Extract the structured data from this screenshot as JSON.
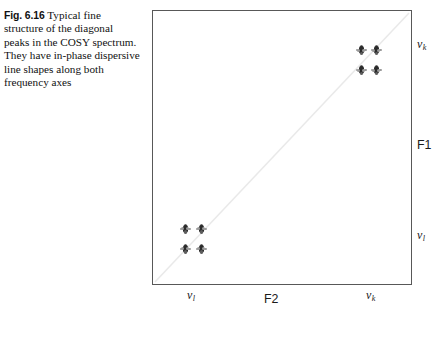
{
  "caption": {
    "figure_number": "Fig. 6.16",
    "text": "Typical fine structure of the diagonal peaks in the COSY spectrum. They have in-phase dispersive line shapes along both frequency axes"
  },
  "chart_data": {
    "type": "scatter",
    "title": "",
    "xlabel": "F2",
    "ylabel": "F1",
    "x_tick_labels": [
      "ν",
      "ν"
    ],
    "x_tick_subscripts": [
      "l",
      "k"
    ],
    "y_tick_labels": [
      "ν",
      "ν"
    ],
    "y_tick_subscripts": [
      "k",
      "l"
    ],
    "grid": false,
    "legend": null,
    "annotations": [
      {
        "name": "diagonal-guide-line",
        "description": "faint diagonal from bottom-left to top-right"
      }
    ],
    "clusters": [
      {
        "name": "diagonal-peak-nu-k",
        "f2": "nu_k",
        "f1": "nu_k",
        "center_x_pct": 83.0,
        "center_y_pct": 18.0,
        "groups": [
          {
            "dx": -7.5,
            "dy": -10.0
          },
          {
            "dx": 7.5,
            "dy": -10.0
          },
          {
            "dx": -7.5,
            "dy": 10.0
          },
          {
            "dx": 7.5,
            "dy": 10.0
          }
        ]
      },
      {
        "name": "diagonal-peak-nu-l",
        "f2": "nu_l",
        "f1": "nu_l",
        "center_x_pct": 15.5,
        "center_y_pct": 83.0,
        "groups": [
          {
            "dx": -8.0,
            "dy": -10.0
          },
          {
            "dx": 8.0,
            "dy": -10.0
          },
          {
            "dx": -8.0,
            "dy": 10.0
          },
          {
            "dx": 8.0,
            "dy": 10.0
          }
        ]
      }
    ]
  },
  "axes": {
    "bottom_axis_name": "F2",
    "right_axis_name": "F1",
    "nu_symbol": "ν",
    "subscript_k": "k",
    "subscript_l": "l"
  }
}
